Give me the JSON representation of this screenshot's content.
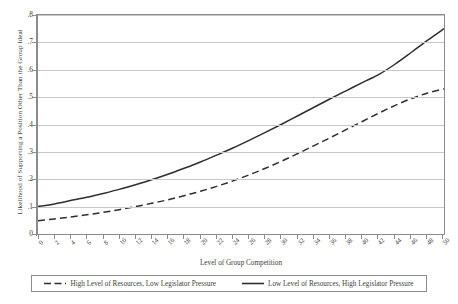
{
  "chart_data": {
    "type": "line",
    "title": "",
    "xlabel": "Level of Group Competition",
    "ylabel": "Likelihood of Supporting a Position Other Than the Group Ideal",
    "xlim": [
      0,
      50
    ],
    "ylim": [
      0,
      0.8
    ],
    "grid": true,
    "legend_position": "bottom",
    "x_tick_labels": [
      "0",
      "2",
      "4",
      "6",
      "8",
      "10",
      "12",
      "14",
      "16",
      "18",
      "20",
      "22",
      "24",
      "26",
      "28",
      "30",
      "32",
      "34",
      "36",
      "38",
      "40",
      "42",
      "44",
      "46",
      "48",
      "50"
    ],
    "y_tick_labels": [
      "0",
      ".1",
      ".2",
      ".3",
      ".4",
      ".5",
      ".6",
      ".7",
      ".8"
    ],
    "y_tick_values": [
      0,
      0.1,
      0.2,
      0.3,
      0.4,
      0.5,
      0.6,
      0.7,
      0.8
    ],
    "x": [
      0,
      2,
      4,
      6,
      8,
      10,
      12,
      14,
      16,
      18,
      20,
      22,
      24,
      26,
      28,
      30,
      32,
      34,
      36,
      38,
      40,
      42,
      44,
      46,
      48,
      50
    ],
    "series": [
      {
        "name": "High Level of Resources, Low Legislator Pressure",
        "style": "dashed",
        "color": "#2e2e2e",
        "values": [
          0.048,
          0.055,
          0.062,
          0.07,
          0.079,
          0.089,
          0.1,
          0.112,
          0.125,
          0.14,
          0.156,
          0.174,
          0.194,
          0.216,
          0.24,
          0.266,
          0.294,
          0.323,
          0.352,
          0.382,
          0.412,
          0.442,
          0.47,
          0.495,
          0.515,
          0.53
        ]
      },
      {
        "name": "Low Level of Resources, High Legislator Pressure",
        "style": "solid",
        "color": "#2e2e2e",
        "values": [
          0.1,
          0.11,
          0.122,
          0.134,
          0.148,
          0.163,
          0.18,
          0.198,
          0.218,
          0.24,
          0.263,
          0.288,
          0.314,
          0.342,
          0.371,
          0.401,
          0.432,
          0.463,
          0.494,
          0.524,
          0.554,
          0.583,
          0.621,
          0.664,
          0.708,
          0.75
        ]
      }
    ]
  },
  "legend": {
    "entries": [
      {
        "label": "High Level of Resources, Low Legislator Pressure",
        "style": "dashed"
      },
      {
        "label": "Low Level of Resources, High Legislator Pressure",
        "style": "solid"
      }
    ]
  },
  "colors": {
    "line": "#2e2e2e",
    "grid": "#c9c9c9",
    "axis": "#8c8c8c",
    "text": "#3d3d3d",
    "background": "#ffffff"
  }
}
